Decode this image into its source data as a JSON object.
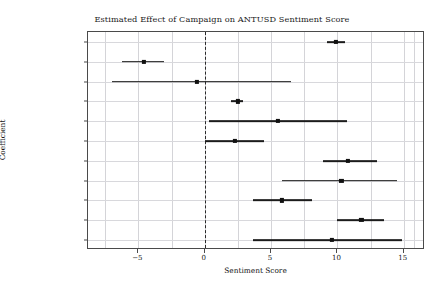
{
  "chart_data": {
    "type": "scatter",
    "title": "Estimated Effect of Campaign on ANTUSD Sentiment Score",
    "xlabel": "Sentiment Score",
    "ylabel": "Coefficient",
    "xlim": [
      -8.8,
      16.6
    ],
    "xticks": [
      -5,
      0,
      5,
      10,
      15
    ],
    "xticklabels": [
      "−5",
      "0",
      "5",
      "10",
      "15"
    ],
    "grid": true,
    "legend": "none",
    "reference_line": {
      "x": 0,
      "style": "dashed",
      "color": "#2a2a2a"
    },
    "marker_color": "#111111",
    "errorbar_color": "#1c1c1c",
    "categories": [
      "India 1962",
      "Soviet 1969",
      "Vietnam 1974",
      "Vietnam 1979",
      "Japan 1990",
      "Japan 1996",
      "Japan 2005",
      "Japan 2010",
      "Japan 2012",
      "Philippines 2016",
      "India 2017"
    ],
    "points": [
      {
        "label": "India 1962",
        "estimate": 9.9,
        "ci_low": 9.2,
        "ci_high": 10.6
      },
      {
        "label": "Soviet 1969",
        "estimate": -4.6,
        "ci_low": -6.2,
        "ci_high": -3.1
      },
      {
        "label": "Vietnam 1974",
        "estimate": -0.6,
        "ci_low": -7.0,
        "ci_high": 6.5
      },
      {
        "label": "Vietnam 1979",
        "estimate": 2.5,
        "ci_low": 2.0,
        "ci_high": 2.9
      },
      {
        "label": "Japan 1990",
        "estimate": 5.5,
        "ci_low": 0.3,
        "ci_high": 10.7
      },
      {
        "label": "Japan 1996",
        "estimate": 2.3,
        "ci_low": 0.0,
        "ci_high": 4.5
      },
      {
        "label": "Japan 2005",
        "estimate": 10.8,
        "ci_low": 8.9,
        "ci_high": 13.0
      },
      {
        "label": "Japan 2010",
        "estimate": 10.3,
        "ci_low": 5.8,
        "ci_high": 14.5
      },
      {
        "label": "Japan 2012",
        "estimate": 5.8,
        "ci_low": 3.6,
        "ci_high": 8.1
      },
      {
        "label": "Philippines 2016",
        "estimate": 11.8,
        "ci_low": 10.0,
        "ci_high": 13.5
      },
      {
        "label": "India 2017",
        "estimate": 9.6,
        "ci_low": 3.6,
        "ci_high": 14.9
      }
    ]
  }
}
